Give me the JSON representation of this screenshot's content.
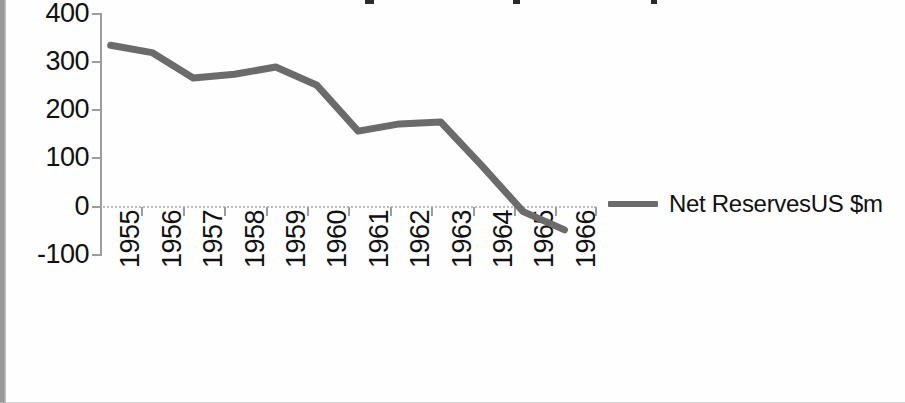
{
  "chart_data": {
    "type": "line",
    "title": "",
    "subtitle": "",
    "xlabel": "",
    "ylabel": "",
    "categories": [
      "1955",
      "1956",
      "1957",
      "1958",
      "1959",
      "1960",
      "1961",
      "1962",
      "1963",
      "1964",
      "1965",
      "1966"
    ],
    "series": [
      {
        "name": "Net ReservesUS $m",
        "color": "#6b6b6b",
        "values": [
          335,
          320,
          267,
          275,
          290,
          252,
          157,
          172,
          176,
          85,
          -10,
          -48
        ]
      }
    ],
    "ylim": [
      -100,
      400
    ],
    "ytick_values": [
      400,
      300,
      200,
      100,
      0,
      -100
    ],
    "ytick_labels": [
      "400",
      "300",
      "200",
      "100",
      "0",
      "-100"
    ],
    "grid": false,
    "legend_position": "right",
    "legend_entries": [
      "Net ReservesUS $m"
    ]
  },
  "legend": {
    "label": "Net ReservesUS $m",
    "swatch_name": "legend-line-swatch",
    "swatch_color": "#6b6b6b"
  },
  "axes": {
    "y_labels": [
      "400",
      "300",
      "200",
      "100",
      "0",
      "-100"
    ],
    "x_labels": [
      "1955",
      "1956",
      "1957",
      "1958",
      "1959",
      "1960",
      "1961",
      "1962",
      "1963",
      "1964",
      "1965",
      "1966"
    ],
    "axis_color": "#9d9d9d"
  },
  "colors": {
    "line": "#6b6b6b",
    "text": "#111111",
    "background": "#fefefe",
    "axis": "#9d9d9d"
  }
}
